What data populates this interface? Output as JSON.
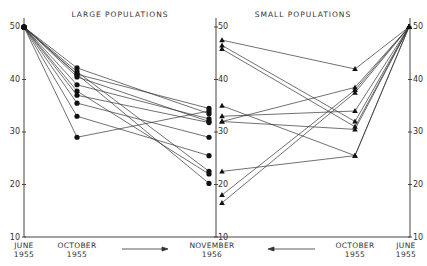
{
  "chart_data": [
    {
      "type": "line",
      "title": "LARGE POPULATIONS",
      "marker": "circle",
      "categories": [
        "JUNE 1955",
        "OCTOBER 1955",
        "NOVEMBER 1956"
      ],
      "ylim": [
        10,
        50
      ],
      "yticks": [
        10,
        20,
        30,
        40,
        50
      ],
      "series": [
        {
          "name": "L1",
          "values": [
            50,
            42.2,
            33.5
          ]
        },
        {
          "name": "L2",
          "values": [
            50,
            41.5,
            22.5
          ]
        },
        {
          "name": "L3",
          "values": [
            50,
            41.0,
            34.5
          ]
        },
        {
          "name": "L4",
          "values": [
            50,
            40.5,
            32.0
          ]
        },
        {
          "name": "L5",
          "values": [
            50,
            39.0,
            32.5
          ]
        },
        {
          "name": "L6",
          "values": [
            50,
            37.8,
            22.0
          ]
        },
        {
          "name": "L7",
          "values": [
            50,
            37.0,
            31.8
          ]
        },
        {
          "name": "L8",
          "values": [
            50,
            35.5,
            29.0
          ]
        },
        {
          "name": "L9",
          "values": [
            50,
            33.0,
            25.5
          ]
        },
        {
          "name": "L10",
          "values": [
            50,
            29.0,
            34.0
          ]
        },
        {
          "name": "L11",
          "values": [
            50,
            41.0,
            20.2
          ]
        }
      ]
    },
    {
      "type": "line",
      "title": "SMALL POPULATIONS",
      "marker": "triangle",
      "categories": [
        "NOVEMBER 1956",
        "OCTOBER 1955",
        "JUNE 1955"
      ],
      "ylim": [
        10,
        50
      ],
      "yticks": [
        10,
        20,
        30,
        40,
        50
      ],
      "series": [
        {
          "name": "S1",
          "values": [
            47.5,
            42.0,
            50
          ]
        },
        {
          "name": "S2",
          "values": [
            46.5,
            32.0,
            50
          ]
        },
        {
          "name": "S3",
          "values": [
            45.8,
            31.0,
            50
          ]
        },
        {
          "name": "S4",
          "values": [
            35.0,
            25.5,
            50
          ]
        },
        {
          "name": "S5",
          "values": [
            33.0,
            34.0,
            50
          ]
        },
        {
          "name": "S6",
          "values": [
            32.0,
            38.5,
            50
          ]
        },
        {
          "name": "S7",
          "values": [
            32.0,
            30.5,
            50
          ]
        },
        {
          "name": "S8",
          "values": [
            22.5,
            25.5,
            50
          ]
        },
        {
          "name": "S9",
          "values": [
            18.0,
            38.0,
            50
          ]
        },
        {
          "name": "S10",
          "values": [
            16.5,
            37.5,
            50
          ]
        }
      ]
    }
  ],
  "labels": {
    "large_title": "LARGE POPULATIONS",
    "small_title": "SMALL POPULATIONS",
    "x_june_1": "JUNE",
    "x_june_2": "1955",
    "x_oct_1": "OCTOBER",
    "x_oct_2": "1955",
    "x_nov_1": "NOVEMBER",
    "x_nov_2": "1956",
    "x_oct_r1": "OCTOBER",
    "x_oct_r2": "1955",
    "x_june_r1": "JUNE",
    "x_june_r2": "1955",
    "y50": "50",
    "y40": "40",
    "y30": "30",
    "y20": "20",
    "y10": "10"
  }
}
